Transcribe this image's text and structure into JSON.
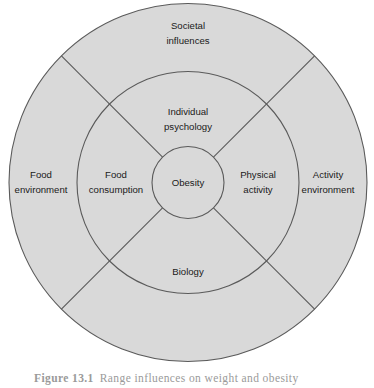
{
  "figure": {
    "background_color": "#ffffff",
    "ring_fill_color": "#d9d9d9",
    "stroke_color": "#5a5a5a",
    "text_color": "#1a1a1a"
  },
  "diagram": {
    "type": "concentric-ring-segment-diagram",
    "core": {
      "label": "Obesity"
    },
    "inner_ring": {
      "segments": [
        {
          "position": "top",
          "line1": "Individual",
          "line2": "psychology"
        },
        {
          "position": "right",
          "line1": "Physical",
          "line2": "activity"
        },
        {
          "position": "bottom",
          "line1": "Biology",
          "line2": ""
        },
        {
          "position": "left",
          "line1": "Food",
          "line2": "consumption"
        }
      ]
    },
    "outer_ring": {
      "segments": [
        {
          "position": "top",
          "line1": "Societal",
          "line2": "influences"
        },
        {
          "position": "right",
          "line1": "Activity",
          "line2": "environment"
        },
        {
          "position": "bottom",
          "line1": "",
          "line2": ""
        },
        {
          "position": "left",
          "line1": "Food",
          "line2": "environment"
        }
      ]
    }
  },
  "caption": {
    "number": "Figure 13.1",
    "text": "Range influences on weight and obesity"
  }
}
